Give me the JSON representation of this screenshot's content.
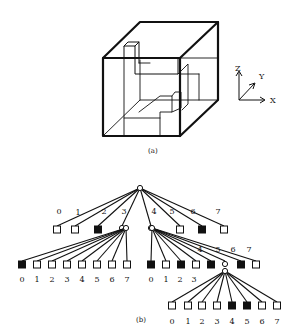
{
  "figure_a": {
    "caption": "(a)",
    "axes": {
      "z": "Z",
      "y": "Y",
      "x": "X"
    }
  },
  "figure_b": {
    "caption": "(b)",
    "root_children_labels": [
      "0",
      "1",
      "2",
      "3",
      "4",
      "5",
      "6",
      "7"
    ],
    "root_children_states": [
      "empty",
      "empty",
      "full",
      "node",
      "node",
      "empty",
      "full",
      "empty"
    ],
    "node3_children_labels": [
      "0",
      "1",
      "2",
      "3",
      "4",
      "5",
      "6",
      "7"
    ],
    "node3_children_states": [
      "full",
      "empty",
      "empty",
      "empty",
      "empty",
      "empty",
      "empty",
      "empty"
    ],
    "node4_children_labels": [
      "0",
      "1",
      "2",
      "3",
      "4",
      "5",
      "6",
      "7"
    ],
    "node4_children_states": [
      "full",
      "empty",
      "full",
      "empty",
      "full",
      "node",
      "full",
      "empty"
    ],
    "node45_children_labels": [
      "0",
      "1",
      "2",
      "3",
      "4",
      "5",
      "6",
      "7"
    ],
    "node45_children_states": [
      "empty",
      "empty",
      "empty",
      "empty",
      "full",
      "full",
      "empty",
      "empty"
    ]
  }
}
